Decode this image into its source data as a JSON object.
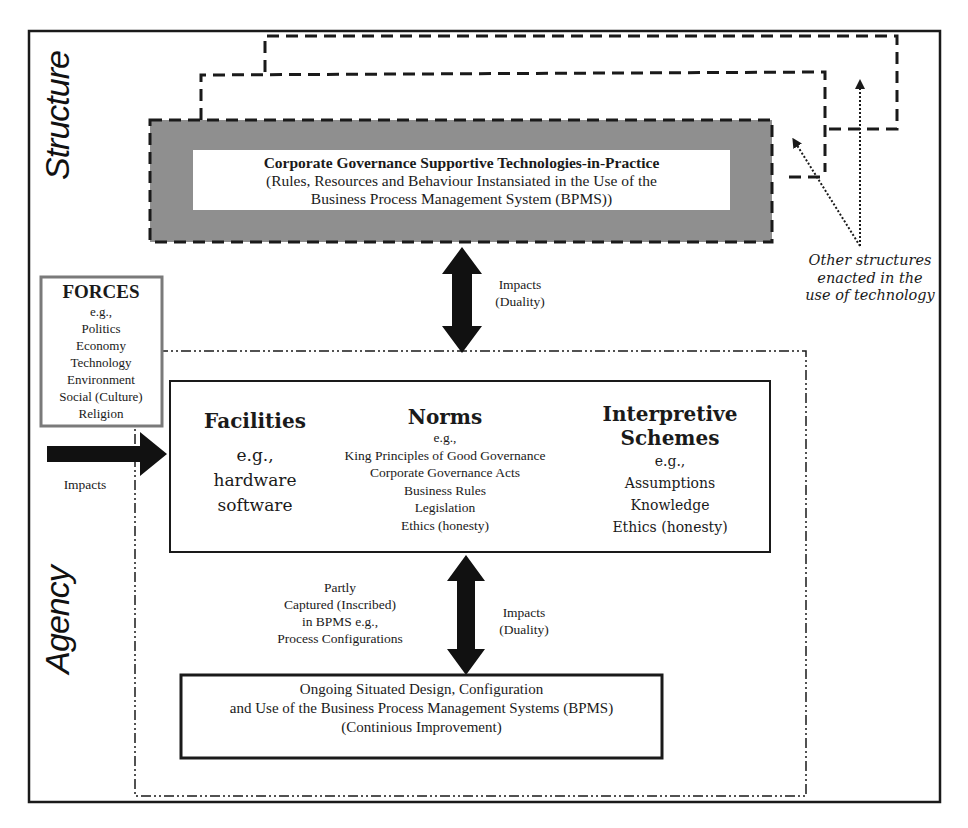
{
  "diagram": {
    "side_labels": {
      "structure": "Structure",
      "agency": "Agency"
    },
    "structure_box": {
      "title": "Corporate Governance Supportive Technologies-in-Practice",
      "line2": "(Rules, Resources and Behaviour Instansiated in the Use of the",
      "line3": "Business Process Management System (BPMS))",
      "fill_color": "#8c8c8c"
    },
    "other_structures": {
      "line1": "Other structures",
      "line2": "enacted in the",
      "line3": "use of technology"
    },
    "forces": {
      "title": "FORCES",
      "eg": "e.g.,",
      "items": [
        "Politics",
        "Economy",
        "Technology",
        "Environment",
        "Social (Culture)",
        "Religion"
      ],
      "border_color": "#7a7a7a"
    },
    "forces_arrow_label": "Impacts",
    "top_arrow_label": {
      "line1": "Impacts",
      "line2": "(Duality)"
    },
    "facilities": {
      "title": "Facilities",
      "items": [
        "e.g.,",
        "hardware",
        "software"
      ]
    },
    "norms": {
      "title": "Norms",
      "eg": "e.g.,",
      "items": [
        "King Principles of Good Governance",
        "Corporate Governance Acts",
        "Business Rules",
        "Legislation",
        "Ethics (honesty)"
      ]
    },
    "interpretive": {
      "title_line1": "Interpretive",
      "title_line2": "Schemes",
      "items": [
        "e.g.,",
        "Assumptions",
        "Knowledge",
        "Ethics (honesty)"
      ]
    },
    "captured_label": {
      "line1": "Partly",
      "line2": "Captured (Inscribed)",
      "line3": "in BPMS e.g.,",
      "line4": "Process Configurations"
    },
    "bottom_arrow_label": {
      "line1": "Impacts",
      "line2": "(Duality)"
    },
    "bottom_box": {
      "line1": "Ongoing Situated Design, Configuration",
      "line2": "and Use of the Business Process Management Systems (BPMS)",
      "line3": "(Continious Improvement)"
    }
  }
}
